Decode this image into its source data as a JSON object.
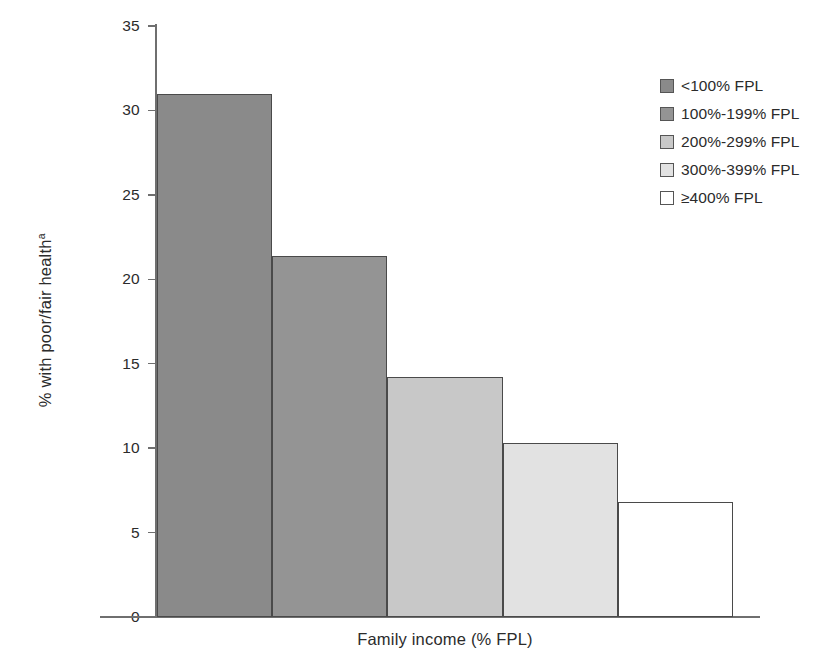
{
  "chart_data": {
    "type": "bar",
    "title": "",
    "xlabel": "Family income (% FPL)",
    "ylabel": "% with poor/fair health",
    "ylabel_superscript": "a",
    "categories": [
      "<100% FPL",
      "100%-199% FPL",
      "200%-299% FPL",
      "300%-399% FPL",
      "≥400% FPL"
    ],
    "values": [
      31.0,
      21.4,
      14.2,
      10.3,
      6.8
    ],
    "ylim": [
      0,
      35
    ],
    "ytick_labels": [
      "35",
      "30",
      "25",
      "20",
      "15",
      "10",
      "5",
      "0"
    ],
    "ytick_values": [
      35,
      30,
      25,
      20,
      15,
      10,
      5,
      0
    ],
    "xtick_labels": [],
    "grid": false,
    "legend_position": "top-right",
    "bar_colors": [
      "#8a8a8a",
      "#949494",
      "#c8c8c8",
      "#e2e2e2",
      "#ffffff"
    ],
    "bar_edge_color": "#4a4a4a",
    "axis_color": "#6f6f6f"
  },
  "legend": {
    "items": [
      {
        "label": "<100% FPL",
        "color": "#8a8a8a"
      },
      {
        "label": "100%-199% FPL",
        "color": "#949494"
      },
      {
        "label": "200%-299% FPL",
        "color": "#c8c8c8"
      },
      {
        "label": "300%-399% FPL",
        "color": "#e2e2e2"
      },
      {
        "label": "≥400% FPL",
        "color": "#ffffff"
      }
    ]
  }
}
